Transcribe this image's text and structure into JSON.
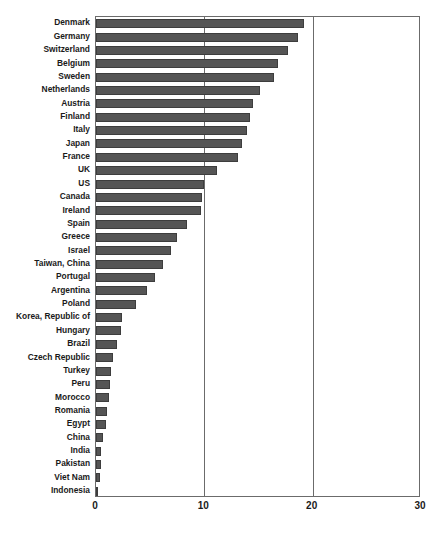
{
  "chart_data": {
    "type": "bar",
    "orientation": "horizontal",
    "title": "",
    "subtitle": "",
    "xlabel": "",
    "ylabel": "",
    "xlim": [
      0,
      30
    ],
    "ylim": null,
    "grid": true,
    "gridlines_x": [
      10,
      20
    ],
    "legend": null,
    "legend_position": "none",
    "xticks": [
      0,
      10,
      20,
      30
    ],
    "xticklabels": [
      "0",
      "10",
      "20",
      "30"
    ],
    "categories": [
      "Denmark",
      "Germany",
      "Switzerland",
      "Belgium",
      "Sweden",
      "Netherlands",
      "Austria",
      "Finland",
      "Italy",
      "Japan",
      "France",
      "UK",
      "US",
      "Canada",
      "Ireland",
      "Spain",
      "Greece",
      "Israel",
      "Taiwan, China",
      "Portugal",
      "Argentina",
      "Poland",
      "Korea, Republic of",
      "Hungary",
      "Brazil",
      "Czech Republic",
      "Turkey",
      "Peru",
      "Morocco",
      "Romania",
      "Egypt",
      "China",
      "India",
      "Pakistan",
      "Viet Nam",
      "Indonesia"
    ],
    "values": [
      19.2,
      18.6,
      17.7,
      16.8,
      16.4,
      15.1,
      14.5,
      14.2,
      13.9,
      13.5,
      13.1,
      11.2,
      10.0,
      9.8,
      9.7,
      8.4,
      7.5,
      6.9,
      6.2,
      5.4,
      4.7,
      3.7,
      2.4,
      2.3,
      1.9,
      1.6,
      1.4,
      1.3,
      1.2,
      1.0,
      0.9,
      0.6,
      0.5,
      0.45,
      0.4,
      0.05
    ],
    "bar_color": "#555555",
    "bar_edge_color": "#3d3d3d",
    "axis_color": "#6b6b6b",
    "background_color": "#ffffff",
    "text_color": "#1a1a1a"
  }
}
